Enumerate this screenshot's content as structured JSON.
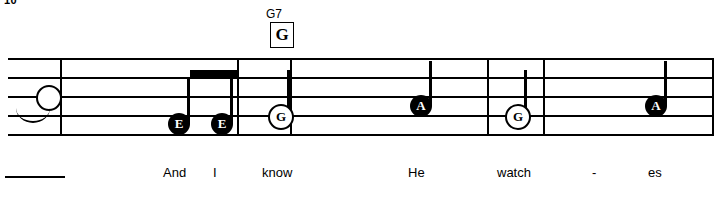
{
  "sheet": {
    "measure_number": "10",
    "chord": {
      "symbol": "G7",
      "box_label": "G"
    },
    "staff": {
      "line_count": 5,
      "barline_positions": [
        60,
        237,
        290,
        487,
        543,
        712
      ]
    },
    "notes": [
      {
        "label": "",
        "type": "open",
        "x": 36,
        "line_y": 38,
        "stem": "none",
        "tie": true
      },
      {
        "label": "E",
        "type": "filled",
        "x": 168,
        "line_y": 66,
        "stem": "up"
      },
      {
        "label": "E",
        "type": "filled",
        "x": 211,
        "line_y": 66,
        "stem": "up"
      },
      {
        "label": "G",
        "type": "open",
        "x": 268,
        "line_y": 57,
        "stem": "up"
      },
      {
        "label": "A",
        "type": "filled",
        "x": 410,
        "line_y": 48,
        "stem": "up"
      },
      {
        "label": "G",
        "type": "open",
        "x": 505,
        "line_y": 57,
        "stem": "up"
      },
      {
        "label": "A",
        "type": "filled",
        "x": 645,
        "line_y": 48,
        "stem": "up"
      }
    ],
    "beam": {
      "x": 190,
      "width": 48,
      "y": 12
    },
    "lyrics": [
      {
        "text": "And",
        "x": 163
      },
      {
        "text": "I",
        "x": 213
      },
      {
        "text": "know",
        "x": 262
      },
      {
        "text": "He",
        "x": 408
      },
      {
        "text": "watch",
        "x": 497
      },
      {
        "text": "-",
        "x": 592
      },
      {
        "text": "es",
        "x": 648
      }
    ],
    "has_lyric_extender": true
  }
}
